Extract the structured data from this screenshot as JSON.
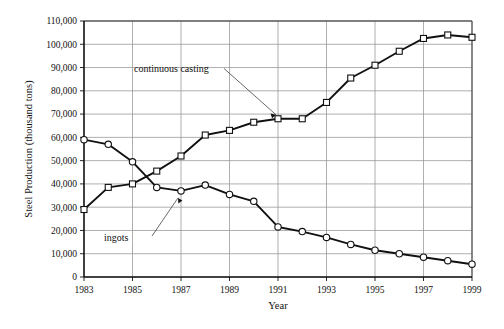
{
  "chart_data": {
    "type": "line",
    "title": "",
    "xlabel": "Year",
    "ylabel": "Steel Production (thousand tons)",
    "xlim": [
      1983,
      1999
    ],
    "ylim": [
      0,
      110000
    ],
    "grid": true,
    "legend_position": "inline-annotations",
    "x": [
      1983,
      1984,
      1985,
      1986,
      1987,
      1988,
      1989,
      1990,
      1991,
      1992,
      1993,
      1994,
      1995,
      1996,
      1997,
      1998,
      1999
    ],
    "xticks": [
      "1983",
      "1985",
      "1987",
      "1989",
      "1991",
      "1993",
      "1995",
      "1997",
      "1999"
    ],
    "yticks": [
      "0",
      "10,000",
      "20,000",
      "30,000",
      "40,000",
      "50,000",
      "60,000",
      "70,000",
      "80,000",
      "90,000",
      "100,000",
      "110,000"
    ],
    "series": [
      {
        "name": "continuous casting",
        "marker": "square",
        "values": [
          29000,
          38500,
          40000,
          45500,
          52000,
          61000,
          63000,
          66500,
          68000,
          68000,
          75000,
          85500,
          91000,
          97000,
          102500,
          104000,
          103000
        ]
      },
      {
        "name": "ingots",
        "marker": "circle",
        "values": [
          59000,
          57000,
          49500,
          38500,
          37000,
          39500,
          35500,
          32500,
          21500,
          19500,
          17000,
          14000,
          11500,
          10000,
          8500,
          7000,
          5500
        ]
      }
    ],
    "annotations": [
      {
        "label": "continuous casting",
        "points_to_series": "continuous casting",
        "points_to_x": 1991
      },
      {
        "label": "ingots",
        "points_to_series": "ingots",
        "points_to_x": 1987
      }
    ]
  }
}
